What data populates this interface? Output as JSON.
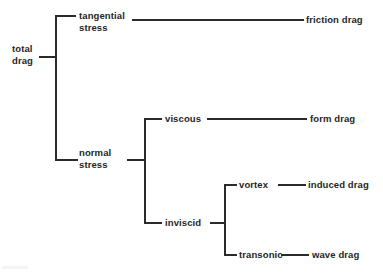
{
  "diagram": {
    "type": "hierarchy-tree",
    "orientation": "left-to-right",
    "colors": {
      "background": "#ffffff",
      "line": "#2b2b2b",
      "text": "#262626"
    },
    "nodes": {
      "total_drag": {
        "label_line1": "total",
        "label_line2": "drag"
      },
      "tangential_stress": {
        "label_line1": "tangential",
        "label_line2": "stress"
      },
      "normal_stress": {
        "label_line1": "normal",
        "label_line2": "stress"
      },
      "friction_drag": {
        "label": "friction drag"
      },
      "viscous": {
        "label": "viscous"
      },
      "form_drag": {
        "label": "form drag"
      },
      "inviscid": {
        "label": "inviscid"
      },
      "vortex": {
        "label": "vortex"
      },
      "induced_drag": {
        "label": "induced drag"
      },
      "transonic": {
        "label": "transonic"
      },
      "wave_drag": {
        "label": "wave drag"
      }
    },
    "edges": [
      {
        "from": "total_drag",
        "to": "tangential_stress"
      },
      {
        "from": "total_drag",
        "to": "normal_stress"
      },
      {
        "from": "tangential_stress",
        "to": "friction_drag"
      },
      {
        "from": "normal_stress",
        "to": "viscous"
      },
      {
        "from": "normal_stress",
        "to": "inviscid"
      },
      {
        "from": "viscous",
        "to": "form_drag"
      },
      {
        "from": "inviscid",
        "to": "vortex"
      },
      {
        "from": "inviscid",
        "to": "transonic"
      },
      {
        "from": "vortex",
        "to": "induced_drag"
      },
      {
        "from": "transonic",
        "to": "wave_drag"
      }
    ]
  }
}
